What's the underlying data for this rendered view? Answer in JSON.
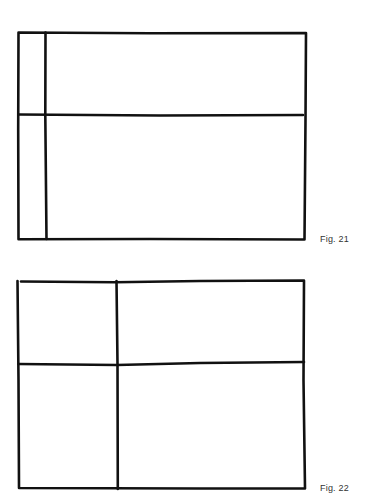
{
  "figures": [
    {
      "label": "Fig. 21",
      "description": "Rectangle divided by a narrow left vertical strip and a horizontal line about 40% from top",
      "frame": {
        "x": 18,
        "y": 32,
        "w": 288,
        "h": 208
      },
      "vertical_line_x": 46,
      "horizontal_line_y": 115
    },
    {
      "label": "Fig. 22",
      "description": "Rectangle divided by a vertical line about one-third from left and a horizontal line about 40% from top",
      "frame": {
        "x": 18,
        "y": 281,
        "w": 287,
        "h": 208
      },
      "vertical_line_x": 117,
      "horizontal_line_y": 364
    }
  ],
  "style": {
    "stroke_color": "#111111",
    "stroke_width": 2.5,
    "label_color": "#333333"
  }
}
